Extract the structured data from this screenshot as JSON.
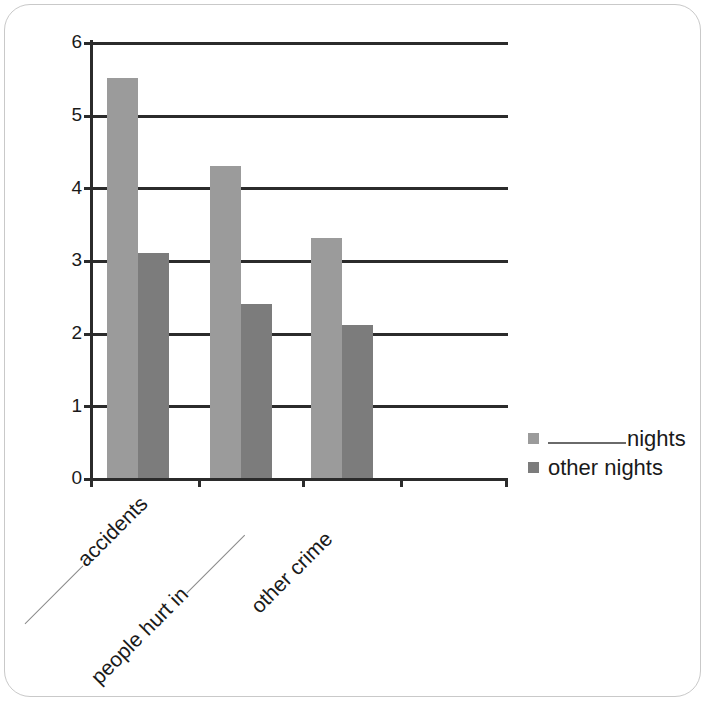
{
  "chart_data": {
    "type": "bar",
    "title": "",
    "xlabel": "",
    "ylabel": "",
    "ylim": [
      0,
      6
    ],
    "yticks": [
      0,
      1,
      2,
      3,
      4,
      5,
      6
    ],
    "grid": true,
    "legend_position": "right",
    "categories": [
      "_______ accidents",
      "people hurt in _______",
      "other crime"
    ],
    "series": [
      {
        "name": "_______ nights",
        "values": [
          5.5,
          4.3,
          3.3
        ],
        "color": "#9b9b9b"
      },
      {
        "name": "other nights",
        "values": [
          3.1,
          2.4,
          2.1
        ],
        "color": "#7c7c7c"
      }
    ]
  },
  "axis": {
    "y_tick_labels": [
      "6",
      "5",
      "4",
      "3",
      "2",
      "1",
      "0"
    ]
  },
  "legend": {
    "items": [
      {
        "prefix_blank": true,
        "label": "nights",
        "swatch": "s0"
      },
      {
        "prefix_blank": false,
        "label": "other nights",
        "swatch": "s1"
      }
    ]
  },
  "x_labels": [
    {
      "before_blank": true,
      "text": "accidents",
      "after_blank": false
    },
    {
      "before_blank": false,
      "text": "people hurt in",
      "after_blank": true
    },
    {
      "before_blank": false,
      "text": "other crime",
      "after_blank": false
    }
  ]
}
